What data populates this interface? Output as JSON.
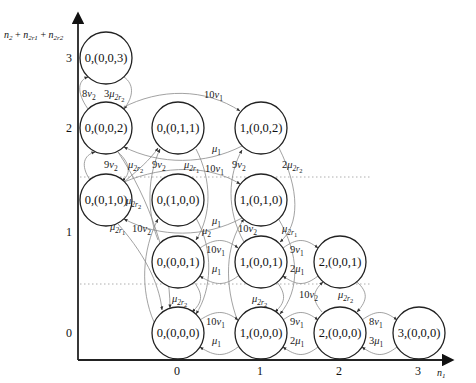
{
  "diagram": {
    "axes": {
      "y_title": "n2 + n2r1 + n2r2",
      "y_title_parts": {
        "a": "n",
        "a_sub": "2",
        "b": "n",
        "b_sub": "2r1",
        "c": "n",
        "c_sub": "2r2"
      },
      "x_title": "n1",
      "x_title_parts": {
        "a": "n",
        "a_sub": "1"
      },
      "x_ticks": [
        "0",
        "1",
        "2",
        "3"
      ],
      "y_ticks": [
        "0",
        "1",
        "2",
        "3"
      ]
    },
    "nodes": [
      {
        "id": "s003",
        "label": "0,(0,0,3)"
      },
      {
        "id": "s002",
        "label": "0,(0,0,2)"
      },
      {
        "id": "s011",
        "label": "0,(0,1,1)"
      },
      {
        "id": "s1002",
        "label": "1,(0,0,2)"
      },
      {
        "id": "s010",
        "label": "0,(0,1,0)"
      },
      {
        "id": "s100",
        "label": "0,(1,0,0)"
      },
      {
        "id": "s1010",
        "label": "1,(0,1,0)"
      },
      {
        "id": "s001",
        "label": "0,(0,0,1)"
      },
      {
        "id": "s1001",
        "label": "1,(0,0,1)"
      },
      {
        "id": "s2001",
        "label": "2,(0,0,1)"
      },
      {
        "id": "s000",
        "label": "0,(0,0,0)"
      },
      {
        "id": "s1000",
        "label": "1,(0,0,0)"
      },
      {
        "id": "s2000",
        "label": "2,(0,0,0)"
      },
      {
        "id": "s3000",
        "label": "3,(0,0,0)"
      }
    ],
    "edges": [
      {
        "from": "s002",
        "to": "s003",
        "rate": "8ν2"
      },
      {
        "from": "s003",
        "to": "s002",
        "rate": "3μ2r2"
      },
      {
        "from": "s002",
        "to": "s1002",
        "rate": "10ν1"
      },
      {
        "from": "s1002",
        "to": "s002",
        "rate": "μ1"
      },
      {
        "from": "s010",
        "to": "s002",
        "rate": "9ν2"
      },
      {
        "from": "s002",
        "to": "s010",
        "rate": "μ2r2"
      },
      {
        "from": "s001",
        "to": "s011",
        "rate": "9ν2"
      },
      {
        "from": "s011",
        "to": "s001",
        "rate": "μ2r1"
      },
      {
        "from": "s1001",
        "to": "s1002",
        "rate": "9ν2"
      },
      {
        "from": "s1002",
        "to": "s1001",
        "rate": "2μ2r2"
      },
      {
        "from": "s010",
        "to": "s1010",
        "rate": "10ν1"
      },
      {
        "from": "s1010",
        "to": "s010",
        "rate": "μ1"
      },
      {
        "from": "s010",
        "to": "s000",
        "rate": "μ2r1"
      },
      {
        "from": "s000",
        "to": "s100",
        "rate": "10ν2"
      },
      {
        "from": "s100",
        "to": "s000",
        "rate": "μ2"
      },
      {
        "from": "s1000",
        "to": "s1010",
        "rate": "10ν2"
      },
      {
        "from": "s1010",
        "to": "s1000",
        "rate": "μ2r1"
      },
      {
        "from": "s001",
        "to": "s1001",
        "rate": "10ν1"
      },
      {
        "from": "s1001",
        "to": "s001",
        "rate": "μ1"
      },
      {
        "from": "s1001",
        "to": "s2001",
        "rate": "9ν1"
      },
      {
        "from": "s2001",
        "to": "s1001",
        "rate": "2μ1"
      },
      {
        "from": "s001",
        "to": "s000",
        "rate": "μ2r2"
      },
      {
        "from": "s1001",
        "to": "s1000",
        "rate": "μ2r2"
      },
      {
        "from": "s2000",
        "to": "s2001",
        "rate": "10ν2"
      },
      {
        "from": "s2001",
        "to": "s2000",
        "rate": "μ2r2"
      },
      {
        "from": "s000",
        "to": "s1000",
        "rate": "10ν1"
      },
      {
        "from": "s1000",
        "to": "s000",
        "rate": "μ1"
      },
      {
        "from": "s1000",
        "to": "s2000",
        "rate": "9ν1"
      },
      {
        "from": "s2000",
        "to": "s1000",
        "rate": "2μ1"
      },
      {
        "from": "s2000",
        "to": "s3000",
        "rate": "8ν1"
      },
      {
        "from": "s3000",
        "to": "s2000",
        "rate": "3μ1"
      }
    ],
    "rate_labels": {
      "r_8v2": {
        "coef": "8",
        "sym": "v",
        "sub": "2"
      },
      "r_3mu2r2": {
        "coef": "3",
        "sym": "μ",
        "sub": "2r",
        "subsub": "2"
      },
      "r_10v1_top": {
        "coef": "10",
        "sym": "v",
        "sub": "1"
      },
      "r_mu1_top": {
        "coef": "",
        "sym": "μ",
        "sub": "1"
      },
      "r_9v2_a": {
        "coef": "9",
        "sym": "v",
        "sub": "2"
      },
      "r_mu2r2_a": {
        "coef": "",
        "sym": "μ",
        "sub": "2r",
        "subsub": "2"
      },
      "r_9v2_b": {
        "coef": "9",
        "sym": "v",
        "sub": "2"
      },
      "r_mu2r1_a": {
        "coef": "",
        "sym": "μ",
        "sub": "2r",
        "subsub": "1"
      },
      "r_9v2_c": {
        "coef": "9",
        "sym": "v",
        "sub": "2"
      },
      "r_2mu2r2": {
        "coef": "2",
        "sym": "μ",
        "sub": "2r",
        "subsub": "2"
      },
      "r_10v1_mid": {
        "coef": "10",
        "sym": "v",
        "sub": "1"
      },
      "r_mu2r2_b": {
        "coef": "",
        "sym": "μ",
        "sub": "2r",
        "subsub": "2"
      },
      "r_mu1_mid": {
        "coef": "",
        "sym": "μ",
        "sub": "1"
      },
      "r_mu2r1_b": {
        "coef": "",
        "sym": "μ",
        "sub": "2r",
        "subsub": "1"
      },
      "r_10v2_a": {
        "coef": "10",
        "sym": "v",
        "sub": "2"
      },
      "r_mu2": {
        "coef": "",
        "sym": "μ",
        "sub": "2"
      },
      "r_10v2_b": {
        "coef": "10",
        "sym": "v",
        "sub": "2"
      },
      "r_mu2r1_c": {
        "coef": "",
        "sym": "μ",
        "sub": "2r",
        "subsub": "1"
      },
      "r_10v1_low": {
        "coef": "10",
        "sym": "v",
        "sub": "1"
      },
      "r_mu1_low": {
        "coef": "",
        "sym": "μ",
        "sub": "1"
      },
      "r_9v1_low": {
        "coef": "9",
        "sym": "v",
        "sub": "1"
      },
      "r_2mu1_low": {
        "coef": "2",
        "sym": "μ",
        "sub": "1"
      },
      "r_mu2r2_c": {
        "coef": "",
        "sym": "μ",
        "sub": "2r",
        "subsub": "2"
      },
      "r_mu2r2_d": {
        "coef": "",
        "sym": "μ",
        "sub": "2r",
        "subsub": "2"
      },
      "r_10v2_c": {
        "coef": "10",
        "sym": "v",
        "sub": "2"
      },
      "r_mu2r2_e": {
        "coef": "",
        "sym": "μ",
        "sub": "2r",
        "subsub": "2"
      },
      "r_10v1_bot": {
        "coef": "10",
        "sym": "v",
        "sub": "1"
      },
      "r_mu1_bot": {
        "coef": "",
        "sym": "μ",
        "sub": "1"
      },
      "r_9v1_bot": {
        "coef": "9",
        "sym": "v",
        "sub": "1"
      },
      "r_2mu1_bot": {
        "coef": "2",
        "sym": "μ",
        "sub": "1"
      },
      "r_8v1": {
        "coef": "8",
        "sym": "v",
        "sub": "1"
      },
      "r_3mu1": {
        "coef": "3",
        "sym": "μ",
        "sub": "1"
      }
    }
  }
}
